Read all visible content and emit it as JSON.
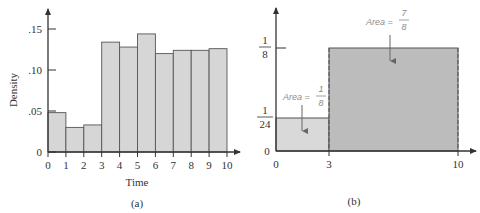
{
  "chart_data": [
    {
      "panel": "(a)",
      "type": "bar",
      "title": "",
      "xlabel": "Time",
      "ylabel": "Density",
      "categories": [
        "0-1",
        "1-2",
        "2-3",
        "3-4",
        "4-5",
        "5-6",
        "6-7",
        "7-8",
        "8-9",
        "9-10"
      ],
      "x_edges": [
        0,
        1,
        2,
        3,
        4,
        5,
        6,
        7,
        8,
        9,
        10
      ],
      "values": [
        0.048,
        0.03,
        0.033,
        0.134,
        0.128,
        0.144,
        0.12,
        0.124,
        0.124,
        0.126
      ],
      "xticks": [
        "0",
        "1",
        "2",
        "3",
        "4",
        "5",
        "6",
        "7",
        "8",
        "9",
        "10"
      ],
      "yticks": [
        "0",
        ".05",
        ".10",
        ".15"
      ],
      "ylim": [
        0,
        0.17
      ],
      "xlim": [
        0,
        10
      ],
      "grid": false,
      "colors": {
        "fill": "#d6d6d6",
        "stroke": "#555555"
      }
    },
    {
      "panel": "(b)",
      "type": "area",
      "title": "",
      "xlabel": "",
      "ylabel": "",
      "segments": [
        {
          "x_start": 0,
          "x_end": 3,
          "density": 0.041667,
          "density_label": "1/24",
          "area_label": "Area = 1/8",
          "area": 0.125
        },
        {
          "x_start": 3,
          "x_end": 10,
          "density": 0.125,
          "density_label": "1/8",
          "area_label": "Area = 7/8",
          "area": 0.875
        }
      ],
      "xticks": [
        "0",
        "3",
        "10"
      ],
      "yticks": [
        "0",
        "1/24",
        "1/8"
      ],
      "xlim": [
        0,
        10
      ],
      "grid": false,
      "colors": {
        "light_fill": "#d9d9d9",
        "dark_fill": "#bcbcbc",
        "stroke": "#555555"
      }
    }
  ],
  "panel_a": {
    "caption": "(a)",
    "xlabel": "Time",
    "ylabel": "Density",
    "yticks": [
      ".15",
      ".10",
      ".05",
      "0"
    ],
    "xticks": [
      "0",
      "1",
      "2",
      "3",
      "4",
      "5",
      "6",
      "7",
      "8",
      "9",
      "10"
    ]
  },
  "panel_b": {
    "caption": "(b)",
    "ytick_1_8_num": "1",
    "ytick_1_8_den": "8",
    "ytick_1_24_num": "1",
    "ytick_1_24_den": "24",
    "ytick_zero": "0",
    "xticks": [
      "0",
      "3",
      "10"
    ],
    "area_big_prefix": "Area =",
    "area_big_num": "7",
    "area_big_den": "8",
    "area_small_prefix": "Area =",
    "area_small_num": "1",
    "area_small_den": "8"
  }
}
